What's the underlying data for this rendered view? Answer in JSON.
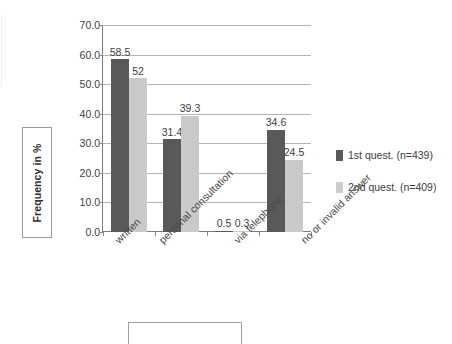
{
  "chart_data": {
    "type": "bar",
    "title": "",
    "xlabel": "",
    "ylabel": "Frequency in %",
    "ylim": [
      0,
      70
    ],
    "ytick_step": 10,
    "ytick_labels": [
      "70.0",
      "60.0",
      "50.0",
      "40.0",
      "30.0",
      "20.0",
      "10.0",
      "0.0"
    ],
    "ytick_values": [
      70,
      60,
      50,
      40,
      30,
      20,
      10,
      0
    ],
    "grid": true,
    "legend_position": "right",
    "categories": [
      "written",
      "personal consultation",
      "via telephone",
      "no or invalid answer"
    ],
    "series": [
      {
        "name": "1st quest. (n=439)",
        "color": "#595959",
        "values": [
          58.5,
          31.4,
          0.5,
          34.6
        ],
        "labels": [
          "58.5",
          "31.4",
          "0.5",
          "34.6"
        ]
      },
      {
        "name": "2nd quest. (n=409)",
        "color": "#c9c9c9",
        "values": [
          52,
          39.3,
          0.3,
          24.5
        ],
        "labels": [
          "52",
          "39.3",
          "0.3",
          "24.5"
        ]
      }
    ]
  },
  "axis": {
    "y_title": "Frequency in %"
  },
  "legend": {
    "entries": [
      {
        "label": "1st quest. (n=439)",
        "swatch": "#595959"
      },
      {
        "label": "2nd quest. (n=409)",
        "swatch": "#cccccc"
      }
    ]
  }
}
